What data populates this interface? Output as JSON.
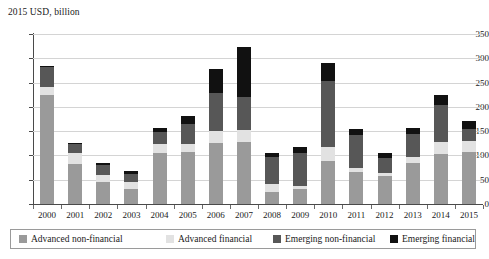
{
  "chart_data": {
    "type": "bar",
    "title": "2015 USD, billion",
    "subtitle": "",
    "xlabel": "",
    "ylabel": "2015 USD, billion",
    "stacked": true,
    "grid": true,
    "legend_position": "bottom",
    "ylim": [
      0,
      350
    ],
    "yticks": [
      0,
      50,
      100,
      150,
      200,
      250,
      300,
      350
    ],
    "categories": [
      "2000",
      "2001",
      "2002",
      "2003",
      "2004",
      "2005",
      "2006",
      "2007",
      "2008",
      "2009",
      "2010",
      "2011",
      "2012",
      "2013",
      "2014",
      "2015"
    ],
    "series": [
      {
        "name": "Advanced non-financial",
        "color": "#9a9a9a",
        "values": [
          225,
          83,
          45,
          30,
          105,
          107,
          126,
          127,
          24,
          30,
          88,
          66,
          57,
          85,
          103,
          107
        ]
      },
      {
        "name": "Advanced financial",
        "color": "#e2e2e2",
        "values": [
          15,
          22,
          14,
          15,
          18,
          16,
          24,
          25,
          17,
          7,
          30,
          8,
          6,
          11,
          24,
          23
        ]
      },
      {
        "name": "Emerging non-financial",
        "color": "#575757",
        "values": [
          43,
          18,
          22,
          16,
          26,
          42,
          78,
          68,
          56,
          68,
          136,
          68,
          32,
          48,
          77,
          24
        ]
      },
      {
        "name": "Emerging financial",
        "color": "#111111",
        "values": [
          2,
          2,
          4,
          6,
          7,
          16,
          50,
          104,
          8,
          13,
          37,
          13,
          10,
          13,
          21,
          17
        ]
      }
    ],
    "totals": [
      285,
      125,
      85,
      67,
      156,
      181,
      278,
      324,
      105,
      118,
      291,
      155,
      105,
      157,
      225,
      171
    ]
  },
  "legend": {
    "items": [
      {
        "label": "Advanced non-financial",
        "color": "#9a9a9a"
      },
      {
        "label": "Advanced financial",
        "color": "#e2e2e2"
      },
      {
        "label": "Emerging non-financial",
        "color": "#575757"
      },
      {
        "label": "Emerging financial",
        "color": "#111111"
      }
    ]
  }
}
